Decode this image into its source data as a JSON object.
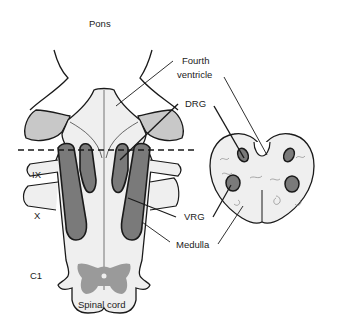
{
  "diagram": {
    "labels": {
      "pons": "Pons",
      "fourth_ventricle_line1": "Fourth",
      "fourth_ventricle_line2": "ventricle",
      "drg": "DRG",
      "vrg": "VRG",
      "medulla": "Medulla",
      "ix": "IX",
      "x": "X",
      "c1": "C1",
      "spinal_cord": "Spinal cord"
    },
    "colors": {
      "outline": "#1a1a1a",
      "tissue_fill": "#efefef",
      "light_gray": "#c8c8c8",
      "dark_gray": "#7a7a7a",
      "gray_matter": "#9a9a9a"
    }
  }
}
